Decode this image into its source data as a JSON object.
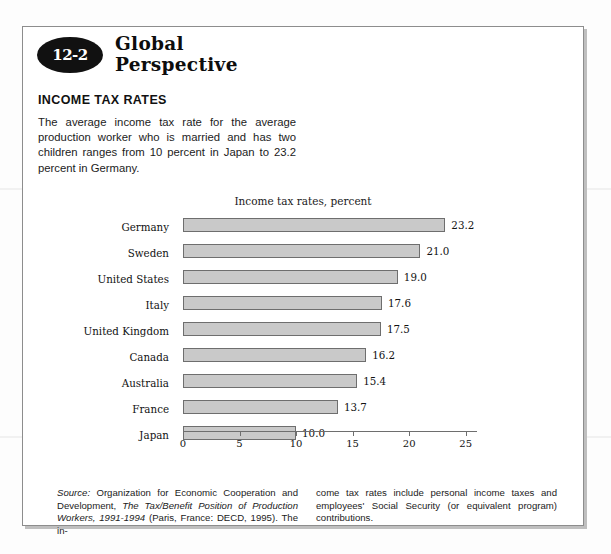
{
  "box": {
    "badge_number": "12-2",
    "title_line1": "Global",
    "title_line2": "Perspective",
    "section_heading": "INCOME TAX RATES",
    "intro": "The average income tax rate for the average production worker who is married and has two children ranges from 10 percent in Japan to 23.2 percent in Germany."
  },
  "footnote": {
    "source_label": "Source:",
    "col1_a": " Organization for Economic Cooperation and Development, ",
    "col1_italic": "The Tax/Benefit Position of Production Workers, 1991-1994",
    "col1_b": " (Paris, France: DECD, 1995). The in-",
    "col2": "come tax rates include personal income taxes and employees' Social Security (or equivalent program) contributions."
  },
  "chart_data": {
    "type": "bar",
    "orientation": "horizontal",
    "title": "Income tax rates, percent",
    "xlabel": "",
    "ylabel": "",
    "xlim": [
      0,
      26
    ],
    "xticks": [
      0,
      5,
      10,
      15,
      20,
      25
    ],
    "xtick_labels": [
      "0",
      "5",
      "10",
      "15",
      "20",
      "25"
    ],
    "grid": false,
    "legend": "none",
    "categories": [
      "Germany",
      "Sweden",
      "United States",
      "Italy",
      "United Kingdom",
      "Canada",
      "Australia",
      "France",
      "Japan"
    ],
    "values": [
      23.2,
      21.0,
      19.0,
      17.6,
      17.5,
      16.2,
      15.4,
      13.7,
      10.0
    ],
    "value_labels": [
      "23.2",
      "21.0",
      "19.0",
      "17.6",
      "17.5",
      "16.2",
      "15.4",
      "13.7",
      "10.0"
    ],
    "bar_fill": "#c9c9c9",
    "bar_edge": "#6e6e6e"
  }
}
